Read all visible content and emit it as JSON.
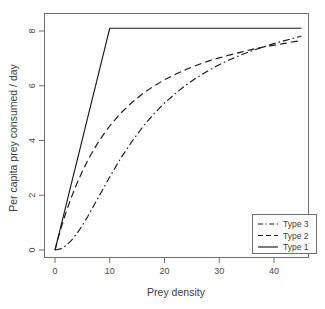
{
  "chart_data": {
    "type": "line",
    "title": "",
    "xlabel": "Prey density",
    "ylabel": "Per capita prey consumed / day",
    "xlim": [
      0,
      46
    ],
    "ylim": [
      0,
      8.4
    ],
    "xticks": [
      0,
      10,
      20,
      30,
      40
    ],
    "yticks": [
      0,
      2,
      4,
      6,
      8
    ],
    "xticklabels": [
      "0",
      "10",
      "20",
      "30",
      "40"
    ],
    "yticklabels": [
      "0",
      "2",
      "4",
      "6",
      "8"
    ],
    "grid": false,
    "legend_position": "bottom-right",
    "x": [
      0,
      1,
      2,
      3,
      4,
      5,
      6,
      7,
      8,
      9,
      10,
      12,
      14,
      16,
      18,
      20,
      22,
      24,
      26,
      28,
      30,
      32,
      34,
      36,
      38,
      40,
      42,
      44,
      45
    ],
    "series": [
      {
        "name": "Type 3",
        "linestyle": "dashdot",
        "color": "#1a1a1a",
        "values": [
          0.0,
          0.04,
          0.16,
          0.35,
          0.6,
          0.9,
          1.23,
          1.59,
          1.95,
          2.31,
          2.67,
          3.35,
          3.95,
          4.49,
          4.96,
          5.37,
          5.72,
          6.04,
          6.31,
          6.55,
          6.77,
          6.96,
          7.13,
          7.28,
          7.42,
          7.54,
          7.65,
          7.76,
          7.81
        ]
      },
      {
        "name": "Type 2",
        "linestyle": "dashed",
        "color": "#1a1a1a",
        "values": [
          0.0,
          0.73,
          1.37,
          1.93,
          2.43,
          2.88,
          3.28,
          3.64,
          3.97,
          4.26,
          4.53,
          5.0,
          5.38,
          5.71,
          5.98,
          6.22,
          6.42,
          6.6,
          6.76,
          6.9,
          7.02,
          7.13,
          7.23,
          7.33,
          7.41,
          7.48,
          7.55,
          7.62,
          7.65
        ]
      },
      {
        "name": "Type 1",
        "linestyle": "solid",
        "color": "#1a1a1a",
        "values": [
          0.0,
          0.81,
          1.62,
          2.43,
          3.24,
          4.05,
          4.86,
          5.67,
          6.48,
          7.29,
          8.1,
          8.1,
          8.1,
          8.1,
          8.1,
          8.1,
          8.1,
          8.1,
          8.1,
          8.1,
          8.1,
          8.1,
          8.1,
          8.1,
          8.1,
          8.1,
          8.1,
          8.1,
          8.1
        ]
      }
    ],
    "legend_entries": [
      {
        "label": "Type 3",
        "linestyle": "dashdot"
      },
      {
        "label": "Type 2",
        "linestyle": "dashed"
      },
      {
        "label": "Type 1",
        "linestyle": "solid"
      }
    ]
  }
}
